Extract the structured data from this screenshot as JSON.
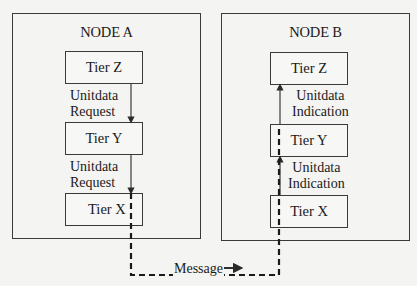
{
  "nodes": [
    {
      "title": "NODE A",
      "tiers": [
        "Tier Z",
        "Tier Y",
        "Tier X"
      ],
      "arrows": [
        {
          "line1": "Unitdata",
          "line2": "Request",
          "direction": "down"
        },
        {
          "line1": "Unitdata",
          "line2": "Request",
          "direction": "down"
        }
      ]
    },
    {
      "title": "NODE B",
      "tiers": [
        "Tier Z",
        "Tier Y",
        "Tier X"
      ],
      "arrows": [
        {
          "line1": "Unitdata",
          "line2": "Indication",
          "direction": "up"
        },
        {
          "line1": "Unitdata",
          "line2": "Indication",
          "direction": "up"
        }
      ]
    }
  ],
  "message": {
    "label": "Message",
    "arrow": "right"
  },
  "colors": {
    "line": "#3a3a3a",
    "background": "#f4f4f2"
  }
}
